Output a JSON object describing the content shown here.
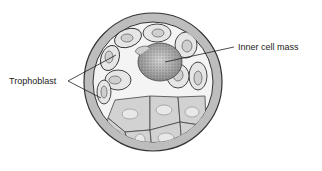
{
  "diagram": {
    "type": "blastocyst-cross-section",
    "labels": {
      "trophoblast": "Trophoblast",
      "inner_cell_mass": "Inner cell mass"
    },
    "colors": {
      "zona": "#b8b8b8",
      "outline": "#3a3a3a",
      "trophoblast_cell": "#e4e4e4",
      "lower_cell": "#cfcfcf",
      "inner_cell_mass": "#9a9a9a",
      "cavity": "#ffffff"
    }
  }
}
